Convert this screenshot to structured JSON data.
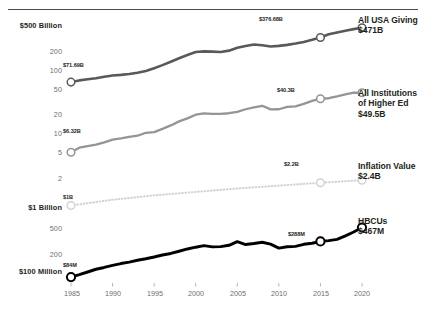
{
  "chart_data": {
    "type": "line",
    "title": "",
    "xlabel": "",
    "ylabel": "",
    "scale": "log",
    "grid": false,
    "legend_position": "right",
    "xlim": [
      1985,
      2020
    ],
    "ylim": [
      100000000,
      500000000000
    ],
    "x_ticks": [
      "1985",
      "1990",
      "1995",
      "2000",
      "2005",
      "2010",
      "2015",
      "2020"
    ],
    "y_ticks": [
      {
        "label": "$500 Billion",
        "value": 500000000000,
        "major": true
      },
      {
        "label": "200",
        "value": 200000000000,
        "major": false
      },
      {
        "label": "100",
        "value": 100000000000,
        "major": false
      },
      {
        "label": "50",
        "value": 50000000000,
        "major": false
      },
      {
        "label": "20",
        "value": 20000000000,
        "major": false
      },
      {
        "label": "10",
        "value": 10000000000,
        "major": false
      },
      {
        "label": "5",
        "value": 5000000000,
        "major": false
      },
      {
        "label": "2",
        "value": 2000000000,
        "major": false
      },
      {
        "label": "$1 Billion",
        "value": 1000000000,
        "major": true
      },
      {
        "label": "500",
        "value": 500000000,
        "major": false
      },
      {
        "label": "200",
        "value": 200000000,
        "major": false
      },
      {
        "label": "$100 Million",
        "value": 100000000,
        "major": true
      }
    ],
    "series": [
      {
        "name": "All USA Giving",
        "legend_label": "All USA Giving",
        "legend_value": "$471B",
        "color": "#58595b",
        "style": "solid",
        "width": 2.6,
        "start_label": "$71.69B",
        "mid_label": "$376.68B",
        "x": [
          1985,
          1986,
          1987,
          1988,
          1989,
          1990,
          1991,
          1992,
          1993,
          1994,
          1995,
          1996,
          1997,
          1998,
          1999,
          2000,
          2001,
          2002,
          2003,
          2004,
          2005,
          2006,
          2007,
          2008,
          2009,
          2010,
          2011,
          2012,
          2013,
          2014,
          2015,
          2016,
          2017,
          2018,
          2019,
          2020
        ],
        "values": [
          71.69,
          76.0,
          79.0,
          82.0,
          86.0,
          90.0,
          92.0,
          95.0,
          99.0,
          105.0,
          116.0,
          129.0,
          145.0,
          164.0,
          183.0,
          203.0,
          208.0,
          206.0,
          203.0,
          213.0,
          235.0,
          250.0,
          263.0,
          257.0,
          246.0,
          251.0,
          260.0,
          272.0,
          288.0,
          310.0,
          336.0,
          376.68,
          400.0,
          424.0,
          449.0,
          471.0
        ],
        "units": "billions USD"
      },
      {
        "name": "All Institutions of Higher Ed",
        "legend_label": "All Institutions\nof Higher Ed",
        "legend_value": "$49.5B",
        "color": "#939598",
        "style": "solid",
        "width": 2.3,
        "start_label": "$6.32B",
        "mid_label": "$40.3B",
        "x": [
          1985,
          1986,
          1987,
          1988,
          1989,
          1990,
          1991,
          1992,
          1993,
          1994,
          1995,
          1996,
          1997,
          1998,
          1999,
          2000,
          2001,
          2002,
          2003,
          2004,
          2005,
          2006,
          2007,
          2008,
          2009,
          2010,
          2011,
          2012,
          2013,
          2014,
          2015,
          2016,
          2017,
          2018,
          2019,
          2020
        ],
        "values": [
          6.32,
          7.4,
          7.8,
          8.2,
          8.9,
          9.8,
          10.2,
          10.8,
          11.2,
          12.4,
          12.7,
          14.2,
          16.0,
          18.4,
          20.4,
          23.2,
          24.2,
          23.9,
          23.9,
          24.4,
          25.6,
          28.0,
          29.8,
          31.6,
          27.9,
          28.0,
          30.3,
          31.0,
          33.8,
          37.5,
          40.3,
          41.0,
          43.6,
          46.7,
          49.6,
          49.5
        ],
        "units": "billions USD"
      },
      {
        "name": "Inflation Value",
        "legend_label": "Inflation Value",
        "legend_value": "$2.4B",
        "color": "#d1d3d4",
        "style": "dotted",
        "width": 2.1,
        "start_label": "$1B",
        "mid_label": "$2.2B",
        "x": [
          1985,
          1990,
          1995,
          2000,
          2005,
          2010,
          2015,
          2020
        ],
        "values": [
          1.0,
          1.22,
          1.42,
          1.6,
          1.8,
          1.99,
          2.2,
          2.4
        ],
        "units": "billions USD"
      },
      {
        "name": "HBCUs",
        "legend_label": "HBCUs",
        "legend_value": "$467M",
        "color": "#000000",
        "style": "solid",
        "width": 2.9,
        "start_label": "$84M",
        "mid_label": "$288M",
        "x": [
          1985,
          1986,
          1987,
          1988,
          1989,
          1990,
          1991,
          1992,
          1993,
          1994,
          1995,
          1996,
          1997,
          1998,
          1999,
          2000,
          2001,
          2002,
          2003,
          2004,
          2005,
          2006,
          2007,
          2008,
          2009,
          2010,
          2011,
          2012,
          2013,
          2014,
          2015,
          2016,
          2017,
          2018,
          2019,
          2020
        ],
        "values": [
          84,
          91,
          100,
          110,
          117,
          126,
          134,
          141,
          150,
          158,
          168,
          180,
          190,
          205,
          222,
          236,
          249,
          239,
          241,
          252,
          286,
          259,
          268,
          280,
          262,
          229,
          240,
          243,
          261,
          271,
          288,
          296,
          310,
          350,
          400,
          467
        ],
        "units": "millions USD"
      }
    ]
  },
  "legend_items": [
    {
      "label": "All USA Giving",
      "line2": "",
      "value": "$471B"
    },
    {
      "label": "All Institutions",
      "line2": "of Higher Ed",
      "value": "$49.5B"
    },
    {
      "label": "Inflation Value",
      "line2": "",
      "value": "$2.4B"
    },
    {
      "label": "HBCUs",
      "line2": "",
      "value": "$467M"
    }
  ],
  "labels": {
    "usa_start": "$71.69B",
    "usa_mid": "$376.68B",
    "highered_start": "$6.32B",
    "highered_mid": "$40.3B",
    "inflation_start": "$1B",
    "inflation_mid": "$2.2B",
    "hbcu_start": "$84M",
    "hbcu_mid": "$288M"
  },
  "axis": {
    "y0": "$500 Billion",
    "y1": "200",
    "y2": "100",
    "y3": "50",
    "y4": "20",
    "y5": "10",
    "y6": "5",
    "y7": "2",
    "y8": "$1 Billion",
    "y9": "500",
    "y10": "200",
    "y11": "$100 Million",
    "x0": "1985",
    "x1": "1990",
    "x2": "1995",
    "x3": "2000",
    "x4": "2005",
    "x5": "2010",
    "x6": "2015",
    "x7": "2020"
  }
}
